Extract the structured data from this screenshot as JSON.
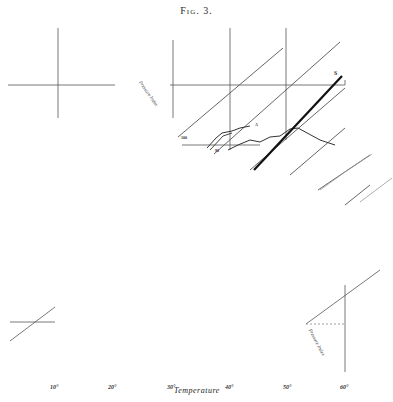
{
  "figure": {
    "title": "Fig. 3.",
    "xlabel": "Temperature",
    "x_ticks": [
      "10°",
      "20°",
      "30°",
      "40°",
      "50°",
      "60°"
    ],
    "upper_axis_label": "Pressure Index",
    "lower_axis_label": "Pressure Index",
    "curve_labels": {
      "thick_line_end": "S",
      "thin_curve_end": "A",
      "left_marker_upper": "100",
      "left_marker_lower": "90"
    },
    "colors": {
      "ink": "#2a2a2a",
      "faint_ink": "#888888",
      "background": "#ffffff"
    }
  }
}
